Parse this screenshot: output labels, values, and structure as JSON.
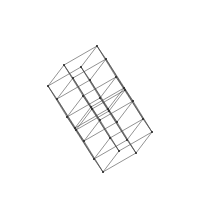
{
  "figure": {
    "type": "wireframe-graph-projection",
    "background_color": "#ffffff",
    "line_color": "#4a4a4a",
    "vertex_color": "#2b2b2b",
    "line_width": 0.6,
    "vertex_radius": 1.0,
    "canvas": {
      "width": 200,
      "height": 218
    },
    "dimensions": 5,
    "vertex_count": 32,
    "edge_count": 80,
    "projection": {
      "center": [
        100,
        109
      ],
      "basis_vectors": [
        {
          "name": "e1",
          "dx": 33.0,
          "dy": -19.0
        },
        {
          "name": "e2",
          "dx": -19.0,
          "dy": -31.0
        },
        {
          "name": "e3",
          "dx": -16.0,
          "dy": 21.0
        },
        {
          "name": "e4",
          "dx": 27.0,
          "dy": 42.0
        },
        {
          "name": "e5",
          "dx": 9.0,
          "dy": 13.0
        }
      ]
    }
  }
}
